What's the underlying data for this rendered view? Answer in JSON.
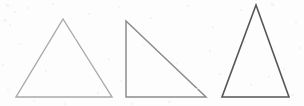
{
  "figure": {
    "name": "three-triangles-figure",
    "background_color": "#fdfdfd",
    "width": 304,
    "height": 106,
    "shape_count": "3"
  },
  "shapes": [
    {
      "id": "triangle-1",
      "label": "equilateral-triangle",
      "kind": "triangle",
      "stroke_color": "#a9a9a9",
      "stroke_width": "1.4",
      "points": "63,19 112,97 16,97",
      "apex": "63,19",
      "base_left": "16,97",
      "base_right": "112,97",
      "base_width_px": "96",
      "height_px": "78"
    },
    {
      "id": "triangle-2",
      "label": "right-triangle",
      "kind": "triangle",
      "stroke_color": "#8c8c8c",
      "stroke_width": "1.5",
      "points": "126,21 206,97 126,97",
      "apex": "126,21",
      "base_left": "126,97",
      "base_right": "206,97",
      "base_width_px": "80",
      "height_px": "76"
    },
    {
      "id": "triangle-3",
      "label": "isosceles-triangle",
      "kind": "triangle",
      "stroke_color": "#565656",
      "stroke_width": "1.6",
      "points": "256,5 289,97 222,97",
      "apex": "256,5",
      "base_left": "222,97",
      "base_right": "289,97",
      "base_width_px": "67",
      "height_px": "92"
    }
  ]
}
